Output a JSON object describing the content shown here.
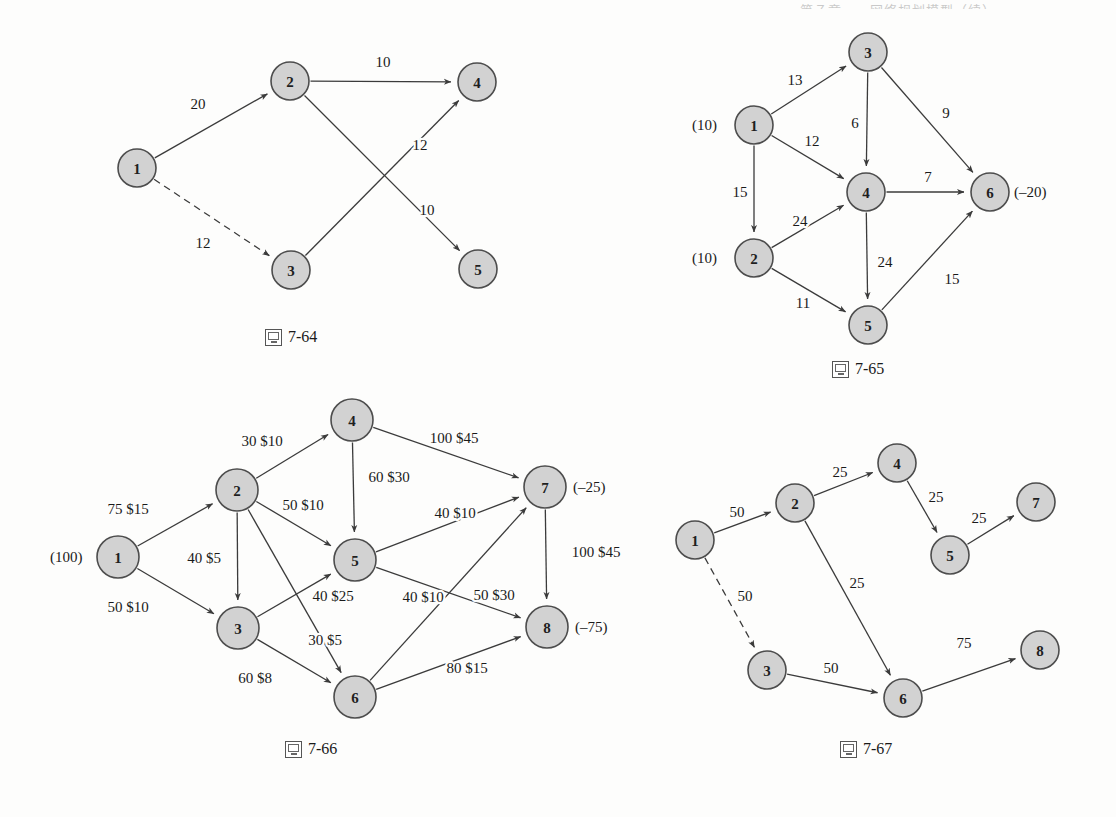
{
  "page": {
    "header_sliver_text": "第７章　　网络规划模型（续）",
    "background_color": "#fdfdfc",
    "node_fill": "#d2d2d2",
    "node_stroke": "#4d4d4d",
    "edge_color": "#3b3b3b",
    "text_color": "#1a1a1a"
  },
  "figures": [
    {
      "id": "fig-7-64",
      "caption": "7-64",
      "caption_icon": "book-icon",
      "frame": {
        "x": 60,
        "y": 20,
        "w": 500,
        "h": 300
      },
      "caption_pos": {
        "x": 265,
        "y": 328
      },
      "node_radius": 19,
      "nodes": [
        {
          "id": "1",
          "label": "1",
          "x": 137,
          "y": 168
        },
        {
          "id": "2",
          "label": "2",
          "x": 290,
          "y": 81
        },
        {
          "id": "3",
          "label": "3",
          "x": 291,
          "y": 270
        },
        {
          "id": "4",
          "label": "4",
          "x": 477,
          "y": 82
        },
        {
          "id": "5",
          "label": "5",
          "x": 478,
          "y": 269
        }
      ],
      "edges": [
        {
          "from": "1",
          "to": "2",
          "label": "20",
          "style": "solid",
          "label_x": 198,
          "label_y": 104
        },
        {
          "from": "1",
          "to": "3",
          "label": "12",
          "style": "dashed",
          "label_x": 203,
          "label_y": 243
        },
        {
          "from": "2",
          "to": "4",
          "label": "10",
          "style": "solid",
          "label_x": 383,
          "label_y": 62
        },
        {
          "from": "2",
          "to": "5",
          "label": "10",
          "style": "solid",
          "label_x": 427,
          "label_y": 210
        },
        {
          "from": "3",
          "to": "4",
          "label": "12",
          "style": "solid",
          "label_x": 420,
          "label_y": 145
        }
      ],
      "supplies": []
    },
    {
      "id": "fig-7-65",
      "caption": "7-65",
      "caption_icon": "book-icon",
      "frame": {
        "x": 680,
        "y": 20,
        "w": 420,
        "h": 330
      },
      "caption_pos": {
        "x": 832,
        "y": 360
      },
      "node_radius": 19,
      "nodes": [
        {
          "id": "1",
          "label": "1",
          "x": 754,
          "y": 125
        },
        {
          "id": "2",
          "label": "2",
          "x": 754,
          "y": 258
        },
        {
          "id": "3",
          "label": "3",
          "x": 868,
          "y": 52
        },
        {
          "id": "4",
          "label": "4",
          "x": 866,
          "y": 192
        },
        {
          "id": "5",
          "label": "5",
          "x": 868,
          "y": 325
        },
        {
          "id": "6",
          "label": "6",
          "x": 990,
          "y": 192
        }
      ],
      "edges": [
        {
          "from": "1",
          "to": "3",
          "label": "13",
          "style": "solid",
          "label_x": 795,
          "label_y": 80
        },
        {
          "from": "1",
          "to": "4",
          "label": "12",
          "style": "solid",
          "label_x": 812,
          "label_y": 141
        },
        {
          "from": "1",
          "to": "2",
          "label": "15",
          "style": "solid",
          "label_x": 740,
          "label_y": 192
        },
        {
          "from": "3",
          "to": "4",
          "label": "6",
          "style": "solid",
          "label_x": 855,
          "label_y": 123
        },
        {
          "from": "3",
          "to": "6",
          "label": "9",
          "style": "solid",
          "label_x": 946,
          "label_y": 113
        },
        {
          "from": "2",
          "to": "4",
          "label": "24",
          "style": "solid",
          "label_x": 800,
          "label_y": 221
        },
        {
          "from": "2",
          "to": "5",
          "label": "11",
          "style": "solid",
          "label_x": 803,
          "label_y": 303
        },
        {
          "from": "4",
          "to": "6",
          "label": "7",
          "style": "solid",
          "label_x": 928,
          "label_y": 177
        },
        {
          "from": "4",
          "to": "5",
          "label": "24",
          "style": "solid",
          "label_x": 885,
          "label_y": 262
        },
        {
          "from": "5",
          "to": "6",
          "label": "15",
          "style": "solid",
          "label_x": 952,
          "label_y": 279
        }
      ],
      "supplies": [
        {
          "node": "1",
          "text": "(10)",
          "x": 692,
          "y": 125,
          "anchor": "start"
        },
        {
          "node": "2",
          "text": "(10)",
          "x": 692,
          "y": 258,
          "anchor": "start"
        },
        {
          "node": "6",
          "text": "(–20)",
          "x": 1014,
          "y": 192,
          "anchor": "start"
        }
      ]
    },
    {
      "id": "fig-7-66",
      "caption": "7-66",
      "caption_icon": "book-icon",
      "frame": {
        "x": 40,
        "y": 390,
        "w": 600,
        "h": 340
      },
      "caption_pos": {
        "x": 285,
        "y": 740
      },
      "node_radius": 21,
      "nodes": [
        {
          "id": "1",
          "label": "1",
          "x": 118,
          "y": 557
        },
        {
          "id": "2",
          "label": "2",
          "x": 237,
          "y": 490
        },
        {
          "id": "3",
          "label": "3",
          "x": 238,
          "y": 628
        },
        {
          "id": "4",
          "label": "4",
          "x": 352,
          "y": 420
        },
        {
          "id": "5",
          "label": "5",
          "x": 355,
          "y": 560
        },
        {
          "id": "6",
          "label": "6",
          "x": 355,
          "y": 697
        },
        {
          "id": "7",
          "label": "7",
          "x": 545,
          "y": 487
        },
        {
          "id": "8",
          "label": "8",
          "x": 547,
          "y": 627
        }
      ],
      "edges": [
        {
          "from": "1",
          "to": "2",
          "label": "75 $15",
          "style": "solid",
          "label_x": 128,
          "label_y": 509
        },
        {
          "from": "1",
          "to": "3",
          "label": "50 $10",
          "style": "solid",
          "label_x": 128,
          "label_y": 607
        },
        {
          "from": "2",
          "to": "4",
          "label": "30 $10",
          "style": "solid",
          "label_x": 262,
          "label_y": 441
        },
        {
          "from": "2",
          "to": "3",
          "label": "40 $5",
          "style": "solid",
          "label_x": 204,
          "label_y": 558
        },
        {
          "from": "2",
          "to": "5",
          "label": "50 $10",
          "style": "solid",
          "label_x": 303,
          "label_y": 505
        },
        {
          "from": "2",
          "to": "6",
          "label": "30 $5",
          "style": "solid",
          "label_x": 325,
          "label_y": 640
        },
        {
          "from": "4",
          "to": "5",
          "label": "60 $30",
          "style": "solid",
          "label_x": 389,
          "label_y": 477
        },
        {
          "from": "4",
          "to": "7",
          "label": "100 $45",
          "style": "solid",
          "label_x": 454,
          "label_y": 438
        },
        {
          "from": "3",
          "to": "5",
          "label": "40 $25",
          "style": "solid",
          "label_x": 333,
          "label_y": 596
        },
        {
          "from": "3",
          "to": "6",
          "label": "60 $8",
          "style": "solid",
          "label_x": 255,
          "label_y": 678
        },
        {
          "from": "5",
          "to": "7",
          "label": "40 $10",
          "style": "solid",
          "label_x": 455,
          "label_y": 513
        },
        {
          "from": "5",
          "to": "8",
          "label": "50 $30",
          "style": "solid",
          "label_x": 494,
          "label_y": 595
        },
        {
          "from": "6",
          "to": "7",
          "label": "40 $10",
          "style": "solid",
          "label_x": 423,
          "label_y": 597
        },
        {
          "from": "6",
          "to": "8",
          "label": "80 $15",
          "style": "solid",
          "label_x": 467,
          "label_y": 668
        },
        {
          "from": "7",
          "to": "8",
          "label": "100 $45",
          "style": "solid",
          "label_x": 596,
          "label_y": 552
        }
      ],
      "supplies": [
        {
          "node": "1",
          "text": "(100)",
          "x": 50,
          "y": 557,
          "anchor": "start"
        },
        {
          "node": "7",
          "text": "(–25)",
          "x": 573,
          "y": 487,
          "anchor": "start"
        },
        {
          "node": "8",
          "text": "(–75)",
          "x": 575,
          "y": 627,
          "anchor": "start"
        }
      ]
    },
    {
      "id": "fig-7-67",
      "caption": "7-67",
      "caption_icon": "book-icon",
      "frame": {
        "x": 650,
        "y": 440,
        "w": 440,
        "h": 290
      },
      "caption_pos": {
        "x": 840,
        "y": 740
      },
      "node_radius": 19,
      "nodes": [
        {
          "id": "1",
          "label": "1",
          "x": 695,
          "y": 540
        },
        {
          "id": "2",
          "label": "2",
          "x": 795,
          "y": 503
        },
        {
          "id": "3",
          "label": "3",
          "x": 767,
          "y": 670
        },
        {
          "id": "4",
          "label": "4",
          "x": 897,
          "y": 463
        },
        {
          "id": "5",
          "label": "5",
          "x": 950,
          "y": 555
        },
        {
          "id": "6",
          "label": "6",
          "x": 903,
          "y": 698
        },
        {
          "id": "7",
          "label": "7",
          "x": 1036,
          "y": 502
        },
        {
          "id": "8",
          "label": "8",
          "x": 1040,
          "y": 650
        }
      ],
      "edges": [
        {
          "from": "1",
          "to": "2",
          "label": "50",
          "style": "solid",
          "label_x": 737,
          "label_y": 512
        },
        {
          "from": "1",
          "to": "3",
          "label": "50",
          "style": "dashed",
          "label_x": 745,
          "label_y": 596
        },
        {
          "from": "2",
          "to": "4",
          "label": "25",
          "style": "solid",
          "label_x": 840,
          "label_y": 472
        },
        {
          "from": "2",
          "to": "6",
          "label": "25",
          "style": "solid",
          "label_x": 857,
          "label_y": 583
        },
        {
          "from": "4",
          "to": "5",
          "label": "25",
          "style": "solid",
          "label_x": 936,
          "label_y": 497
        },
        {
          "from": "5",
          "to": "7",
          "label": "25",
          "style": "solid",
          "label_x": 979,
          "label_y": 518
        },
        {
          "from": "3",
          "to": "6",
          "label": "50",
          "style": "solid",
          "label_x": 831,
          "label_y": 668
        },
        {
          "from": "6",
          "to": "8",
          "label": "75",
          "style": "solid",
          "label_x": 964,
          "label_y": 643
        }
      ],
      "supplies": []
    }
  ]
}
